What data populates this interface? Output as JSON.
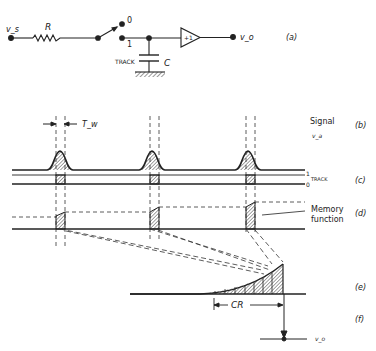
{
  "circuit": {
    "input_label": "v_s",
    "resistor_label": "R",
    "switch_pos0_label": "0",
    "switch_pos1_label": "1",
    "track_label": "TRACK",
    "capacitor_label": "C",
    "buffer_label": "+1",
    "output_label": "v_o",
    "panel_label": "(a)"
  },
  "waveforms": {
    "pulse_width_label": "T_w",
    "signal_label": "Signal",
    "signal_sub_label": "v_a",
    "signal_panel": "(b)",
    "track_one_label": "1",
    "track_zero_label": "0",
    "track_label": "TRACK",
    "track_panel": "(c)",
    "memory_label_line1": "Memory",
    "memory_label_line2": "function",
    "memory_panel": "(d)",
    "weighting_panel": "(e)",
    "cr_label": "CR",
    "output_panel": "(f)",
    "output_label": "v_o"
  },
  "colors": {
    "ink": "#222222",
    "hatch": "#444444",
    "background": "#ffffff"
  }
}
